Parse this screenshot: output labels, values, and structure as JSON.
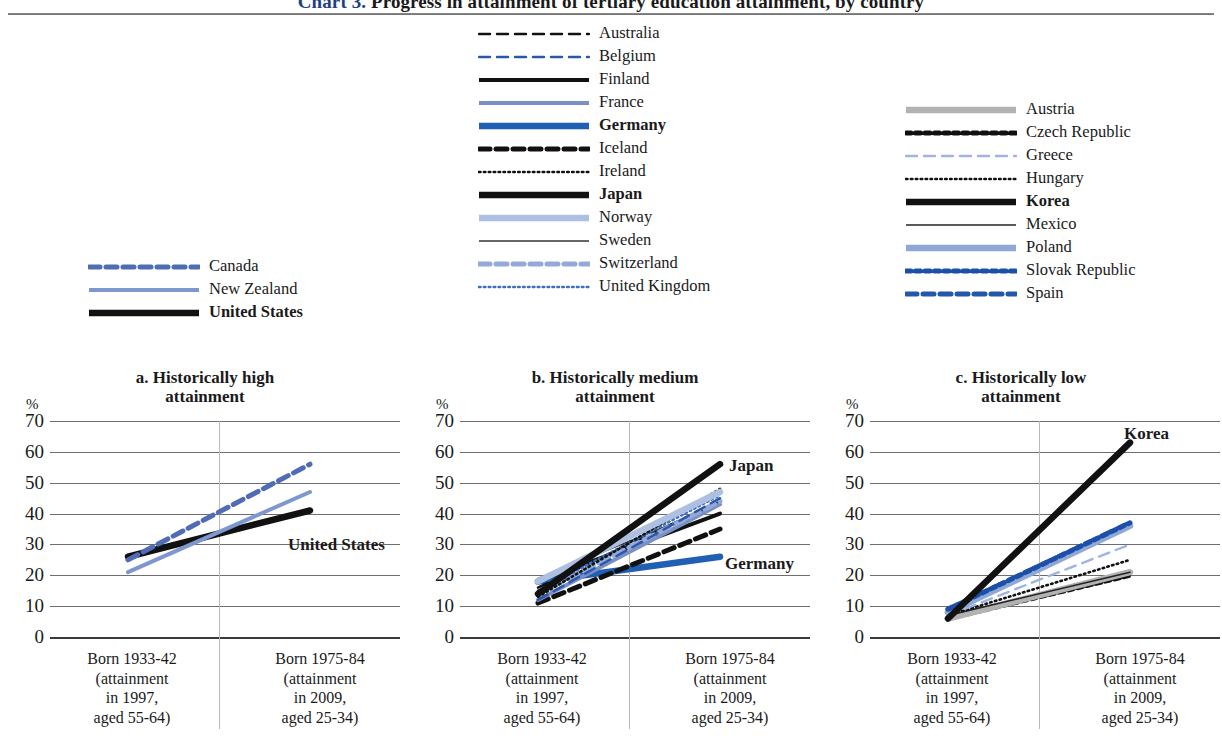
{
  "title": {
    "number": "Chart 3.",
    "text": "Progress in attainment of tertiary education attainment, by country"
  },
  "legends": {
    "left": {
      "name": "historically-high-legend",
      "items": [
        {
          "label": "Canada",
          "bold": false,
          "color": "#4f6cb5",
          "style": "dashed-thick"
        },
        {
          "label": "New Zealand",
          "bold": false,
          "color": "#7e97cf",
          "style": "solid-medium"
        },
        {
          "label": "United States",
          "bold": true,
          "color": "#111111",
          "style": "solid-heavy"
        }
      ]
    },
    "middle": {
      "name": "historically-medium-legend",
      "items": [
        {
          "label": "Australia",
          "bold": false,
          "color": "#111111",
          "style": "dashed-thin"
        },
        {
          "label": "Belgium",
          "bold": false,
          "color": "#2a57ad",
          "style": "dashed-thin"
        },
        {
          "label": "Finland",
          "bold": false,
          "color": "#111111",
          "style": "solid-medium"
        },
        {
          "label": "France",
          "bold": false,
          "color": "#7a8fc4",
          "style": "solid-medium"
        },
        {
          "label": "Germany",
          "bold": true,
          "color": "#1f5fb4",
          "style": "solid-heavy"
        },
        {
          "label": "Iceland",
          "bold": false,
          "color": "#111111",
          "style": "dashed-thick"
        },
        {
          "label": "Ireland",
          "bold": false,
          "color": "#111111",
          "style": "dotted-fine"
        },
        {
          "label": "Japan",
          "bold": true,
          "color": "#111111",
          "style": "solid-heavy"
        },
        {
          "label": "Norway",
          "bold": false,
          "color": "#aec0e2",
          "style": "solid-heavy"
        },
        {
          "label": "Sweden",
          "bold": false,
          "color": "#333333",
          "style": "solid-thin"
        },
        {
          "label": "Switzerland",
          "bold": false,
          "color": "#93aad8",
          "style": "dashed-thick"
        },
        {
          "label": "United Kingdom",
          "bold": false,
          "color": "#3c6fc0",
          "style": "dotted-fine"
        }
      ]
    },
    "right": {
      "name": "historically-low-legend",
      "items": [
        {
          "label": "Austria",
          "bold": false,
          "color": "#b2b2b2",
          "style": "solid-heavy"
        },
        {
          "label": "Czech Republic",
          "bold": false,
          "color": "#111111",
          "style": "dotted-chunky"
        },
        {
          "label": "Greece",
          "bold": false,
          "color": "#9fb4de",
          "style": "dashed-thin"
        },
        {
          "label": "Hungary",
          "bold": false,
          "color": "#111111",
          "style": "dotted-fine"
        },
        {
          "label": "Korea",
          "bold": true,
          "color": "#111111",
          "style": "solid-heavy"
        },
        {
          "label": "Mexico",
          "bold": false,
          "color": "#222222",
          "style": "solid-thin"
        },
        {
          "label": "Poland",
          "bold": false,
          "color": "#8fa8d8",
          "style": "solid-heavy"
        },
        {
          "label": "Slovak Republic",
          "bold": false,
          "color": "#1b4fa8",
          "style": "dotted-chunky"
        },
        {
          "label": "Spain",
          "bold": false,
          "color": "#2356ad",
          "style": "dashed-thick"
        }
      ]
    }
  },
  "axis": {
    "unit": "%",
    "yticks": [
      "70",
      "60",
      "50",
      "40",
      "30",
      "20",
      "10",
      "0"
    ],
    "ylim": [
      0,
      70
    ],
    "xlabels": [
      "Born 1933-42\n(attainment\nin 1997,\naged 55-64)",
      "Born 1975-84\n(attainment\nin 2009,\naged 25-34)"
    ],
    "xlabel_left_l1": "Born 1933-42",
    "xlabel_left_l2": "(attainment",
    "xlabel_left_l3": "in 1997,",
    "xlabel_left_l4": "aged 55-64)",
    "xlabel_right_l1": "Born 1975-84",
    "xlabel_right_l2": "(attainment",
    "xlabel_right_l3": "in 2009,",
    "xlabel_right_l4": "aged 25-34)"
  },
  "panels": {
    "a": {
      "title_l1": "a. Historically high",
      "title_l2": "attainment",
      "annotation": "United States"
    },
    "b": {
      "title_l1": "b. Historically medium",
      "title_l2": "attainment",
      "annotation1": "Japan",
      "annotation2": "Germany"
    },
    "c": {
      "title_l1": "c. Historically low",
      "title_l2": "attainment",
      "annotation": "Korea"
    }
  },
  "chart_data": {
    "type": "line",
    "title": "Chart 3. Progress in attainment of tertiary education attainment, by country",
    "xlabel": "",
    "ylabel": "%",
    "ylim": [
      0,
      70
    ],
    "grid": true,
    "x": [
      "Born 1933-42 (attainment in 1997, aged 55-64)",
      "Born 1975-84 (attainment in 2009, aged 25-34)"
    ],
    "panels": [
      {
        "key": "a",
        "title": "a. Historically high attainment",
        "series": [
          {
            "name": "Canada",
            "values": [
              25,
              56
            ],
            "color": "#4f6cb5",
            "style": "dashed-thick"
          },
          {
            "name": "New Zealand",
            "values": [
              21,
              47
            ],
            "color": "#7e97cf",
            "style": "solid-medium"
          },
          {
            "name": "United States",
            "values": [
              26,
              41
            ],
            "color": "#111111",
            "style": "solid-heavy"
          }
        ]
      },
      {
        "key": "b",
        "title": "b. Historically medium attainment",
        "series": [
          {
            "name": "Japan",
            "values": [
              14,
              56
            ],
            "color": "#111111",
            "style": "solid-heavy"
          },
          {
            "name": "Norway",
            "values": [
              18,
              47
            ],
            "color": "#aec0e2",
            "style": "solid-heavy"
          },
          {
            "name": "Ireland",
            "values": [
              13,
              48
            ],
            "color": "#111111",
            "style": "dotted-fine"
          },
          {
            "name": "United Kingdom",
            "values": [
              15,
              46
            ],
            "color": "#3c6fc0",
            "style": "dotted-fine"
          },
          {
            "name": "Belgium",
            "values": [
              12,
              45
            ],
            "color": "#2a57ad",
            "style": "dashed-thin"
          },
          {
            "name": "Switzerland",
            "values": [
              14,
              44
            ],
            "color": "#93aad8",
            "style": "dashed-thick"
          },
          {
            "name": "France",
            "values": [
              12,
              43
            ],
            "color": "#7a8fc4",
            "style": "solid-medium"
          },
          {
            "name": "Sweden",
            "values": [
              19,
              43
            ],
            "color": "#333333",
            "style": "solid-thin"
          },
          {
            "name": "Finland",
            "values": [
              18,
              40
            ],
            "color": "#111111",
            "style": "solid-medium"
          },
          {
            "name": "Iceland",
            "values": [
              11,
              35
            ],
            "color": "#111111",
            "style": "dashed-thick"
          },
          {
            "name": "Australia",
            "values": [
              16,
              44
            ],
            "color": "#111111",
            "style": "dashed-thin"
          },
          {
            "name": "Germany",
            "values": [
              18,
              26
            ],
            "color": "#1f5fb4",
            "style": "solid-heavy"
          }
        ]
      },
      {
        "key": "c",
        "title": "c. Historically low attainment",
        "series": [
          {
            "name": "Korea",
            "values": [
              6,
              63
            ],
            "color": "#111111",
            "style": "solid-heavy"
          },
          {
            "name": "Slovak Republic",
            "values": [
              9,
              37
            ],
            "color": "#1b4fa8",
            "style": "dotted-chunky"
          },
          {
            "name": "Poland",
            "values": [
              8,
              36
            ],
            "color": "#8fa8d8",
            "style": "solid-heavy"
          },
          {
            "name": "Spain",
            "values": [
              9,
              37
            ],
            "color": "#2356ad",
            "style": "dashed-thick"
          },
          {
            "name": "Greece",
            "values": [
              7,
              30
            ],
            "color": "#9fb4de",
            "style": "dashed-thin"
          },
          {
            "name": "Hungary",
            "values": [
              7,
              25
            ],
            "color": "#111111",
            "style": "dotted-fine"
          },
          {
            "name": "Mexico",
            "values": [
              7,
              21
            ],
            "color": "#222222",
            "style": "solid-thin"
          },
          {
            "name": "Austria",
            "values": [
              6,
              21
            ],
            "color": "#b2b2b2",
            "style": "solid-heavy"
          },
          {
            "name": "Czech Republic",
            "values": [
              6,
              20
            ],
            "color": "#111111",
            "style": "dotted-chunky"
          }
        ]
      }
    ]
  }
}
